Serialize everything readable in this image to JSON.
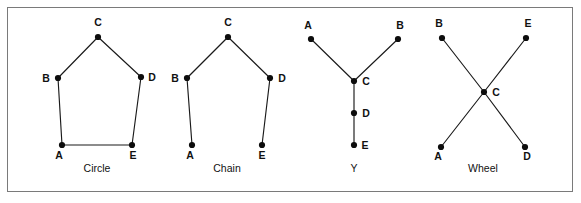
{
  "figure": {
    "border_color": "#7a7a7a",
    "background": "#ffffff",
    "node_color": "#0d0d0d",
    "edge_color": "#1a1a1a"
  },
  "chart_data": {
    "type": "diagram",
    "title": "",
    "subtitle": "",
    "networks": [
      {
        "name": "Circle",
        "label": "Circle",
        "label_pos": {
          "x": 97,
          "y": 172
        },
        "nodes": [
          {
            "id": "A",
            "label": "A",
            "x": 62,
            "y": 145,
            "label_x": 59,
            "label_y": 159,
            "label_anchor": "middle"
          },
          {
            "id": "B",
            "label": "B",
            "x": 58,
            "y": 78,
            "label_x": 46,
            "label_y": 82,
            "label_anchor": "middle"
          },
          {
            "id": "C",
            "label": "C",
            "x": 98,
            "y": 37,
            "label_x": 98,
            "label_y": 26,
            "label_anchor": "middle"
          },
          {
            "id": "D",
            "label": "D",
            "x": 141,
            "y": 77,
            "label_x": 152,
            "label_y": 81,
            "label_anchor": "middle"
          },
          {
            "id": "E",
            "label": "E",
            "x": 132,
            "y": 145,
            "label_x": 133,
            "label_y": 159,
            "label_anchor": "middle"
          }
        ],
        "edges": [
          {
            "from": "A",
            "to": "B"
          },
          {
            "from": "B",
            "to": "C"
          },
          {
            "from": "C",
            "to": "D"
          },
          {
            "from": "D",
            "to": "E"
          },
          {
            "from": "E",
            "to": "A"
          }
        ]
      },
      {
        "name": "Chain",
        "label": "Chain",
        "label_pos": {
          "x": 227,
          "y": 172
        },
        "nodes": [
          {
            "id": "A",
            "label": "A",
            "x": 192,
            "y": 145,
            "label_x": 190,
            "label_y": 159,
            "label_anchor": "middle"
          },
          {
            "id": "B",
            "label": "B",
            "x": 187,
            "y": 78,
            "label_x": 175,
            "label_y": 82,
            "label_anchor": "middle"
          },
          {
            "id": "C",
            "label": "C",
            "x": 228,
            "y": 37,
            "label_x": 228,
            "label_y": 26,
            "label_anchor": "middle"
          },
          {
            "id": "D",
            "label": "D",
            "x": 270,
            "y": 78,
            "label_x": 282,
            "label_y": 82,
            "label_anchor": "middle"
          },
          {
            "id": "E",
            "label": "E",
            "x": 262,
            "y": 145,
            "label_x": 262,
            "label_y": 159,
            "label_anchor": "middle"
          }
        ],
        "edges": [
          {
            "from": "A",
            "to": "B"
          },
          {
            "from": "B",
            "to": "C"
          },
          {
            "from": "C",
            "to": "D"
          },
          {
            "from": "D",
            "to": "E"
          }
        ]
      },
      {
        "name": "Y",
        "label": "Y",
        "label_pos": {
          "x": 354,
          "y": 172
        },
        "nodes": [
          {
            "id": "A",
            "label": "A",
            "x": 311,
            "y": 39,
            "label_x": 308,
            "label_y": 29,
            "label_anchor": "middle"
          },
          {
            "id": "B",
            "label": "B",
            "x": 398,
            "y": 39,
            "label_x": 400,
            "label_y": 29,
            "label_anchor": "middle"
          },
          {
            "id": "C",
            "label": "C",
            "x": 354,
            "y": 81,
            "label_x": 366,
            "label_y": 85,
            "label_anchor": "middle"
          },
          {
            "id": "D",
            "label": "D",
            "x": 354,
            "y": 113,
            "label_x": 366,
            "label_y": 117,
            "label_anchor": "middle"
          },
          {
            "id": "E",
            "label": "E",
            "x": 354,
            "y": 145,
            "label_x": 365,
            "label_y": 149,
            "label_anchor": "middle"
          }
        ],
        "edges": [
          {
            "from": "A",
            "to": "C"
          },
          {
            "from": "B",
            "to": "C"
          },
          {
            "from": "C",
            "to": "D"
          },
          {
            "from": "D",
            "to": "E"
          }
        ]
      },
      {
        "name": "Wheel",
        "label": "Wheel",
        "label_pos": {
          "x": 483,
          "y": 172
        },
        "nodes": [
          {
            "id": "A",
            "label": "A",
            "x": 441,
            "y": 147,
            "label_x": 438,
            "label_y": 160,
            "label_anchor": "middle"
          },
          {
            "id": "B",
            "label": "B",
            "x": 442,
            "y": 38,
            "label_x": 439,
            "label_y": 27,
            "label_anchor": "middle"
          },
          {
            "id": "C",
            "label": "C",
            "x": 484,
            "y": 92,
            "label_x": 496,
            "label_y": 96,
            "label_anchor": "middle"
          },
          {
            "id": "D",
            "label": "D",
            "x": 525,
            "y": 147,
            "label_x": 527,
            "label_y": 160,
            "label_anchor": "middle"
          },
          {
            "id": "E",
            "label": "E",
            "x": 526,
            "y": 38,
            "label_x": 528,
            "label_y": 27,
            "label_anchor": "middle"
          }
        ],
        "edges": [
          {
            "from": "A",
            "to": "C"
          },
          {
            "from": "B",
            "to": "C"
          },
          {
            "from": "C",
            "to": "D"
          },
          {
            "from": "C",
            "to": "E"
          }
        ]
      }
    ]
  }
}
